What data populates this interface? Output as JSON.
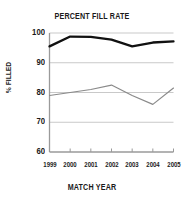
{
  "chart_data": {
    "type": "line",
    "title": "PERCENT FILL RATE",
    "xlabel": "MATCH YEAR",
    "ylabel": "% FILLED",
    "categories": [
      "1999",
      "2000",
      "2001",
      "2002",
      "2003",
      "2004",
      "2005"
    ],
    "x": [
      1999,
      2000,
      2001,
      2002,
      2003,
      2004,
      2005
    ],
    "xlim": [
      1999,
      2005
    ],
    "ylim": [
      60,
      100
    ],
    "yticks": [
      60,
      70,
      80,
      90,
      100
    ],
    "grid": "horizontal",
    "legend": "none",
    "series": [
      {
        "name": "upper-series",
        "color": "#111111",
        "width": 2.3,
        "values": [
          95.5,
          98.8,
          98.7,
          97.8,
          95.5,
          96.8,
          97.2
        ]
      },
      {
        "name": "lower-series",
        "color": "#8a8a8a",
        "width": 1.2,
        "values": [
          79.0,
          80.0,
          81.0,
          82.5,
          79.0,
          76.0,
          81.5
        ]
      }
    ],
    "colors": {
      "axis": "#9a9a9a",
      "grid": "#c9c9c9",
      "text": "#1a1a1a",
      "background": "#ffffff"
    }
  }
}
